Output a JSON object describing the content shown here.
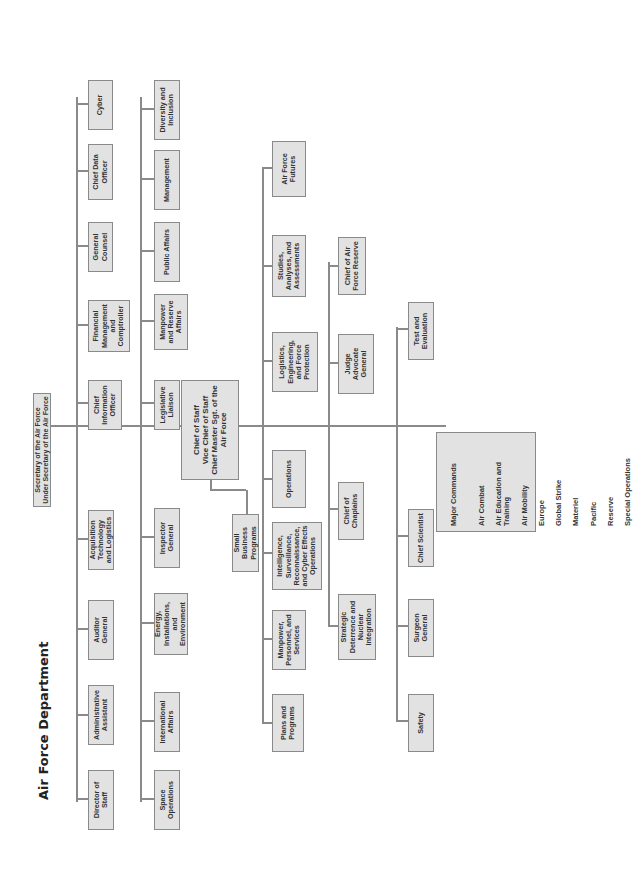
{
  "title": "Air Force Department",
  "secretary": "Secretary of the Air Force\nUnder Secretary of the Air Force",
  "row1": [
    "Director of Staff",
    "Administrative Assistant",
    "Auditor General",
    "Acquisition Technology and Logistics",
    "Chief Information Officer",
    "Financial Management and Comptroller",
    "General Counsel",
    "Chief Data Officer",
    "Cyber"
  ],
  "row2": [
    "Space Operations",
    "International Affairs",
    "Energy, Installations, and Environment",
    "Inspector General",
    "Legislative Liaison",
    "Manpower and Reserve Affairs",
    "Public Affairs",
    "Management",
    "Diversity and Inclusion"
  ],
  "chief_of_staff": "Chief of Staff\nVice Chief of Staff\nChief Master Sgt. of the Air Force",
  "small_business": "Small Business Programs",
  "row3": [
    "Plans and Programs",
    "Manpower, Personnel, and Services",
    "Intelligence, Surveillance, Reconnaissance, and Cyber Effects Operations",
    "Operations",
    "Logistics, Engineering, and Force Protection",
    "Studies, Analyses, and Assessments",
    "Air Force Futures"
  ],
  "row4": [
    "Strategic Deterrence and Nuclear Integration",
    "Chief of Chaplains",
    "Judge Advocate General",
    "Chief of Air Force Reserve"
  ],
  "row5": [
    "Safety",
    "Surgeon General",
    "Chief Scientist",
    "Test and Evaluation"
  ],
  "major_commands": {
    "title": "Major Commands",
    "items": [
      "Air Combat",
      "Air Education and Training",
      "Air Mobility",
      "Europe",
      "Global Strike",
      "Materiel",
      "Pacific",
      "Reserve",
      "Special Operations"
    ]
  }
}
